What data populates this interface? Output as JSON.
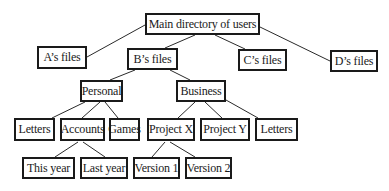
{
  "diagram": {
    "type": "tree",
    "nodes": {
      "root": {
        "label": "Main directory of users"
      },
      "a": {
        "label": "A’s files"
      },
      "b": {
        "label": "B’s files"
      },
      "c": {
        "label": "C’s files"
      },
      "d": {
        "label": "D’s files"
      },
      "personal": {
        "label": "Personal"
      },
      "business": {
        "label": "Business"
      },
      "letters1": {
        "label": "Letters"
      },
      "accounts": {
        "label": "Accounts"
      },
      "games": {
        "label": "Games"
      },
      "projectx": {
        "label": "Project X"
      },
      "projecty": {
        "label": "Project Y"
      },
      "letters2": {
        "label": "Letters"
      },
      "thisyear": {
        "label": "This year"
      },
      "lastyear": {
        "label": "Last year"
      },
      "version1": {
        "label": "Version 1"
      },
      "version2": {
        "label": "Version 2"
      }
    },
    "edges": [
      [
        "root",
        "a"
      ],
      [
        "root",
        "b"
      ],
      [
        "root",
        "c"
      ],
      [
        "root",
        "d"
      ],
      [
        "b",
        "personal"
      ],
      [
        "b",
        "business"
      ],
      [
        "personal",
        "letters1"
      ],
      [
        "personal",
        "accounts"
      ],
      [
        "personal",
        "games"
      ],
      [
        "business",
        "projectx"
      ],
      [
        "business",
        "projecty"
      ],
      [
        "business",
        "letters2"
      ],
      [
        "accounts",
        "thisyear"
      ],
      [
        "accounts",
        "lastyear"
      ],
      [
        "projectx",
        "version1"
      ],
      [
        "projectx",
        "version2"
      ]
    ]
  }
}
